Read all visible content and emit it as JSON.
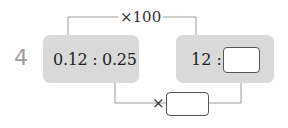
{
  "problem": {
    "number": "4",
    "left_ratio": "0.12 : 0.25",
    "right_ratio_prefix": "12 :",
    "top_operation": "×100",
    "bottom_operation": "×",
    "right_answer_value": "",
    "bottom_answer_value": ""
  },
  "colors": {
    "panel_bg": "#d9d9d9",
    "line": "#9a9a9a",
    "number_label": "#9e9e9e"
  }
}
